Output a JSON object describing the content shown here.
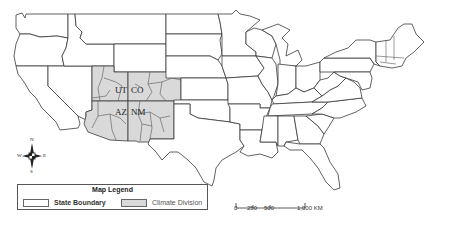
{
  "map": {
    "title": "Southwestern US Climate Divisions Map",
    "state_labels": [
      {
        "id": "UT",
        "text": "UT"
      },
      {
        "id": "CO",
        "text": "CO"
      },
      {
        "id": "AZ",
        "text": "AZ"
      },
      {
        "id": "NM",
        "text": "NM"
      }
    ],
    "colors": {
      "state_fill": "#ffffff",
      "climate_division_fill": "#d9d9d9",
      "boundary_stroke": "#3a3a3a"
    }
  },
  "legend": {
    "title": "Map Legend",
    "items": [
      {
        "label": "State Boundary",
        "swatch_color": "#ffffff"
      },
      {
        "label": "Climate Division",
        "swatch_color": "#d9d9d9"
      }
    ]
  },
  "scale_bar": {
    "ticks": [
      "0",
      "250",
      "500",
      "1,000 KM"
    ]
  },
  "compass": {
    "north": "N",
    "south": "S",
    "east": "E",
    "west": "W"
  }
}
